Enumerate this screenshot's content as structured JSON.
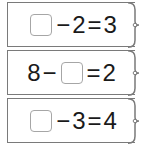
{
  "cards": [
    {
      "tokens": {
        "t0": "",
        "t1": "−",
        "t2": "2",
        "t3": "=",
        "t4": "3"
      },
      "blank_position": 0,
      "text": "□ − 2 = 3"
    },
    {
      "tokens": {
        "t0": "8",
        "t1": "−",
        "t2": "",
        "t3": "=",
        "t4": "2"
      },
      "blank_position": 2,
      "text": "8 − □ = 2"
    },
    {
      "tokens": {
        "t0": "",
        "t1": "−",
        "t2": "3",
        "t3": "=",
        "t4": "4"
      },
      "blank_position": 0,
      "text": "□ − 3 = 4"
    }
  ],
  "colors": {
    "border": "#7a7a7a",
    "blank_border": "#a6a6a6",
    "text": "#1a1a1a",
    "background": "#ffffff"
  }
}
